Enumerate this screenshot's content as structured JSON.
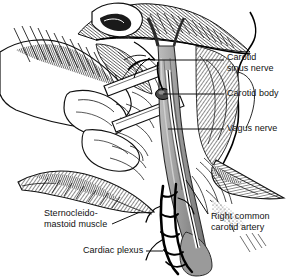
{
  "figure": {
    "style": "black-and-white line engraving with cross-hatching",
    "background_color": "#ffffff",
    "ink_color": "#111111",
    "vessel_gray": "#9a9a9a",
    "vessel_gray_dark": "#7b7b7b"
  },
  "labels": [
    {
      "id": "carotid-sinus-nerve",
      "line1": "Carotid",
      "line2": "sinus nerve",
      "side": "right",
      "x": 227,
      "y": 52,
      "leader": {
        "type": "horizontal",
        "x1": 155,
        "y1": 60,
        "x2": 224,
        "y2": 60
      }
    },
    {
      "id": "carotid-body",
      "line1": "Carotid body",
      "line2": "",
      "side": "right",
      "x": 227,
      "y": 88,
      "leader": {
        "type": "horizontal",
        "x1": 163,
        "y1": 94,
        "x2": 224,
        "y2": 94
      }
    },
    {
      "id": "vagus-nerve",
      "line1": "Vagus nerve",
      "line2": "",
      "side": "right",
      "x": 227,
      "y": 123,
      "leader": {
        "type": "horizontal",
        "x1": 168,
        "y1": 129,
        "x2": 224,
        "y2": 129
      }
    },
    {
      "id": "sternocleidomastoid-muscle",
      "line1": "Sternocleido-",
      "line2": "mastoid muscle",
      "side": "left",
      "x": 44,
      "y": 208,
      "leader": {
        "type": "diagonal",
        "x1": 112,
        "y1": 224,
        "x2": 140,
        "y2": 212
      }
    },
    {
      "id": "right-common-carotid-artery",
      "line1": "Right common",
      "line2": "carotid artery",
      "side": "right",
      "x": 211,
      "y": 211,
      "leader": {
        "type": "diagonal",
        "x1": 208,
        "y1": 214,
        "x2": 186,
        "y2": 180
      }
    },
    {
      "id": "cardiac-plexus",
      "line1": "Cardiac plexus",
      "line2": "",
      "side": "left",
      "x": 83,
      "y": 245,
      "leader": {
        "type": "horizontal",
        "x1": 146,
        "y1": 251,
        "x2": 163,
        "y2": 251
      }
    }
  ]
}
